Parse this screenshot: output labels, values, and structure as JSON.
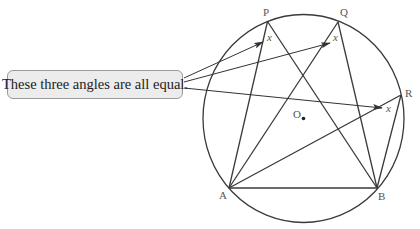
{
  "callout": {
    "text": "These three angles are all equal."
  },
  "diagram": {
    "circle": {
      "center": "O",
      "center_label": "O"
    },
    "points": [
      {
        "name": "P",
        "label": "P"
      },
      {
        "name": "Q",
        "label": "Q"
      },
      {
        "name": "R",
        "label": "R"
      },
      {
        "name": "A",
        "label": "A"
      },
      {
        "name": "B",
        "label": "B"
      }
    ],
    "angle_label": "x",
    "angles": [
      {
        "vertex": "P",
        "label": "x"
      },
      {
        "vertex": "Q",
        "label": "x"
      },
      {
        "vertex": "R",
        "label": "x"
      }
    ],
    "segments": [
      "AP",
      "PB",
      "AQ",
      "QB",
      "AR",
      "RB",
      "AB"
    ],
    "colors": {
      "lines": "#3a3a3a",
      "callout_fill": "#ececec",
      "callout_border": "#9a9a9a"
    }
  }
}
